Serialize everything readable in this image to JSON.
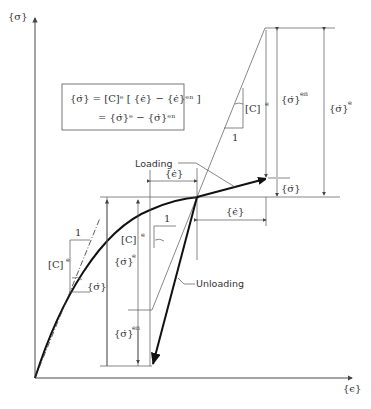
{
  "axes": {
    "y_label": "{σ}",
    "x_label": "{ϵ}"
  },
  "equation_box": {
    "line1": "{σ̇} = [C]ᵉ [ {ϵ̇} − {ϵ̇}ᵉⁿ ]",
    "line2": "= {σ̇}ᵉ − {σ̇}ᵉⁿ"
  },
  "labels": {
    "loading": "Loading",
    "unloading": "Unloading",
    "c_e": "[C]",
    "c_e_sup": "e",
    "one": "1",
    "eps_dot": "{ϵ̇}",
    "sigma_dot": "{σ̇}",
    "sigma_dot_e": "{σ̇}",
    "sigma_dot_e_sup": "e",
    "sigma_dot_en": "{σ̇}",
    "sigma_dot_en_sup": "en"
  },
  "colors": {
    "stroke_dark": "#111111",
    "stroke_thin": "#555555",
    "background": "#ffffff"
  }
}
